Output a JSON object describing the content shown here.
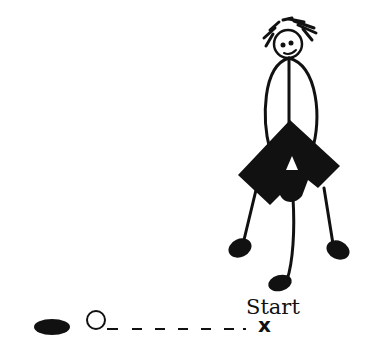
{
  "diagram": {
    "labels": {
      "start": "Start",
      "start_marker": "x"
    },
    "elements": {
      "figure": "stick-figure",
      "ball": "open-circle",
      "disc": "filled-ellipse",
      "path": "dashed-line"
    },
    "colors": {
      "ink": "#111111",
      "background": "#ffffff"
    }
  }
}
